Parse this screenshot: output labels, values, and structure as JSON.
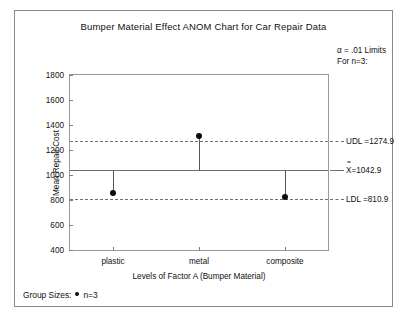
{
  "chart_data": {
    "type": "scatter",
    "title": "Bumper Material Effect ANOM Chart for Car Repair Data",
    "xlabel": "Levels of Factor A (Bumper Material)",
    "ylabel": "Mean Repair Cost",
    "categories": [
      "plastic",
      "metal",
      "composite"
    ],
    "values": [
      859,
      1309,
      826
    ],
    "ylim": [
      400,
      1800
    ],
    "yticks": [
      400,
      600,
      800,
      1000,
      1200,
      1400,
      1600,
      1800
    ],
    "ytick_labels": [
      "400",
      "600",
      "800",
      "1000",
      "1200",
      "1400",
      "1600",
      "1800"
    ],
    "grid": false,
    "legend_position": "bottom-left",
    "reference_lines": [
      {
        "key": "UDL",
        "label": "UDL =1274.9",
        "value": 1274.9,
        "style": "dashed"
      },
      {
        "key": "CL",
        "label": "=1042.9",
        "value": 1042.9,
        "style": "solid",
        "prefix": "X"
      },
      {
        "key": "LDL",
        "label": "LDL =810.9",
        "value": 810.9,
        "style": "dashed"
      }
    ],
    "annotations": [
      "α = .01  Limits",
      "For n=3:"
    ],
    "series": [
      {
        "name": "Group means",
        "values": [
          859,
          1309,
          826
        ]
      }
    ]
  },
  "notes": {
    "alpha_line": "α = .01  Limits",
    "n_line": "For n=3:"
  },
  "footer": {
    "group_sizes_label": "Group Sizes:",
    "n_value": "n=3"
  },
  "colors": {
    "frame": "#8a8a8a",
    "axis": "#9a9a9a",
    "reference": "#6f6f6f",
    "marker": "#0d0d0d",
    "text": "#111111"
  }
}
